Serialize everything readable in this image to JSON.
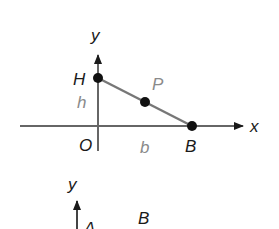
{
  "figure_top": {
    "axes": {
      "x_label": "x",
      "y_label": "y"
    },
    "points": [
      {
        "name": "H",
        "label": "H"
      },
      {
        "name": "P",
        "label": "P"
      },
      {
        "name": "B",
        "label": "B"
      }
    ],
    "origin_label": "O",
    "segment_labels": {
      "height": "h",
      "base": "b"
    },
    "colors": {
      "axis": "#666666",
      "segment": "#777777",
      "point": "#111111",
      "label_dark": "#1a1a1a",
      "label_gray": "#8a8a8a"
    }
  },
  "figure_bottom": {
    "axes": {
      "y_label": "y"
    },
    "points": [
      {
        "name": "A",
        "label": "A"
      },
      {
        "name": "B",
        "label": "B"
      }
    ]
  }
}
